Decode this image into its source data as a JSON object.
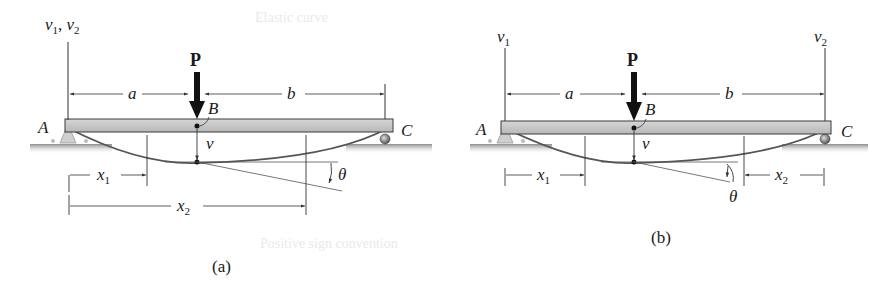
{
  "figure": {
    "colors": {
      "beam_fill": "#c9c9c9",
      "beam_edge": "#3a3a3a",
      "elastic_curve": "#555555",
      "lines": "#333333",
      "ground": "#9a9a9a"
    },
    "panels": [
      {
        "id": "a",
        "caption": "(a)",
        "axis_label": "v",
        "axis_label_sub": "1",
        "axis_label_sep": ", ",
        "axis_label_2": "v",
        "axis_label_2_sub": "2",
        "load_label": "P",
        "point_labels": {
          "left_support": "A",
          "load_point": "B",
          "right_support": "C"
        },
        "dimensions": {
          "left_span": "a",
          "right_span": "b"
        },
        "deflection_label": "v",
        "slope_label": "θ",
        "coordinates": [
          {
            "label": "x",
            "sub": "1",
            "origin": "A",
            "direction": "right"
          },
          {
            "label": "x",
            "sub": "2",
            "origin": "A",
            "direction": "right"
          }
        ]
      },
      {
        "id": "b",
        "caption": "(b)",
        "axis_label_left": "v",
        "axis_label_left_sub": "1",
        "axis_label_right": "v",
        "axis_label_right_sub": "2",
        "load_label": "P",
        "point_labels": {
          "left_support": "A",
          "load_point": "B",
          "right_support": "C"
        },
        "dimensions": {
          "left_span": "a",
          "right_span": "b"
        },
        "deflection_label": "v",
        "slope_label": "θ",
        "coordinates": [
          {
            "label": "x",
            "sub": "1",
            "origin": "A",
            "direction": "right"
          },
          {
            "label": "x",
            "sub": "2",
            "origin": "C",
            "direction": "left"
          }
        ]
      }
    ]
  },
  "show_through": {
    "texts": [
      "Elastic curve",
      "Positive sign convention"
    ]
  }
}
